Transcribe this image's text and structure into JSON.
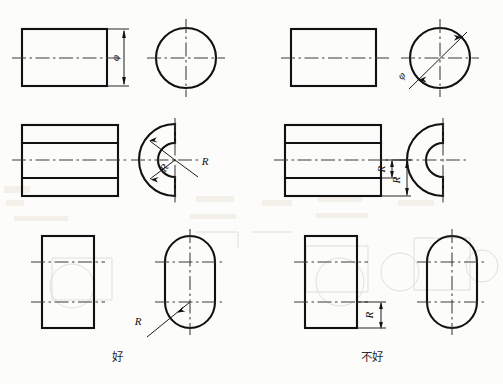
{
  "figure": {
    "width": 503,
    "height": 384,
    "columns": [
      {
        "key": "good",
        "caption": "好",
        "caption_x": 117,
        "caption_y": 361
      },
      {
        "key": "bad",
        "caption": "不好",
        "caption_x": 372,
        "caption_y": 361
      }
    ],
    "colors": {
      "background": "#fcfcfa",
      "outline": "#111111",
      "centerline": "#3a3a3a",
      "dimension": "#1c1c1c",
      "caption": "#2a2a2a"
    }
  },
  "rows": [
    {
      "id": "row-cylinder",
      "name": "cylinder",
      "good": {
        "view_front": {
          "shape": "rectangle",
          "x": 22,
          "y": 29,
          "w": 85,
          "h": 57
        },
        "view_side": {
          "shape": "circle",
          "cx": 186,
          "cy": 58,
          "r": 30
        },
        "dimension": {
          "label": "φ",
          "rotated": true,
          "placed_on": "front-view"
        }
      },
      "bad": {
        "view_front": {
          "shape": "rectangle",
          "x": 291,
          "y": 29,
          "w": 85,
          "h": 57
        },
        "view_side": {
          "shape": "circle",
          "cx": 440,
          "cy": 58,
          "r": 30
        },
        "dimension": {
          "label": "φ",
          "rotated": true,
          "placed_on": "side-view-diagonal"
        }
      }
    },
    {
      "id": "row-ring",
      "name": "c-shaped-ring",
      "good": {
        "view_front": {
          "shape": "rectangle-with-bands",
          "x": 22,
          "y": 125,
          "w": 96,
          "h": 71
        },
        "view_side": {
          "shape": "half-annulus",
          "cx": 175,
          "cy": 160,
          "r_outer": 36,
          "r_inner": 17
        },
        "dimensions": [
          {
            "label": "R",
            "rotated": true,
            "placed_on": "side-view"
          },
          {
            "label": "R",
            "rotated": false,
            "placed_on": "side-view"
          }
        ]
      },
      "bad": {
        "view_front": {
          "shape": "rectangle-with-bands",
          "x": 285,
          "y": 125,
          "w": 96,
          "h": 71
        },
        "view_side": {
          "shape": "half-annulus",
          "cx": 443,
          "cy": 160,
          "r_outer": 36,
          "r_inner": 17
        },
        "dimensions": [
          {
            "label": "R",
            "rotated": true,
            "placed_on": "front-view"
          },
          {
            "label": "R",
            "rotated": true,
            "placed_on": "front-view"
          }
        ]
      }
    },
    {
      "id": "row-obround",
      "name": "obround-slot",
      "good": {
        "view_front": {
          "shape": "rectangle",
          "x": 42,
          "y": 236,
          "w": 52,
          "h": 92
        },
        "view_side": {
          "shape": "obround",
          "cx": 190,
          "cy": 282,
          "w": 50,
          "h": 92
        },
        "dimension": {
          "label": "R",
          "rotated": false,
          "placed_on": "side-view"
        }
      },
      "bad": {
        "view_front": {
          "shape": "rectangle",
          "x": 305,
          "y": 236,
          "w": 52,
          "h": 92
        },
        "view_side": {
          "shape": "obround",
          "cx": 452,
          "cy": 282,
          "w": 50,
          "h": 92
        },
        "dimension": {
          "label": "R",
          "rotated": true,
          "placed_on": "front-view"
        }
      }
    }
  ]
}
